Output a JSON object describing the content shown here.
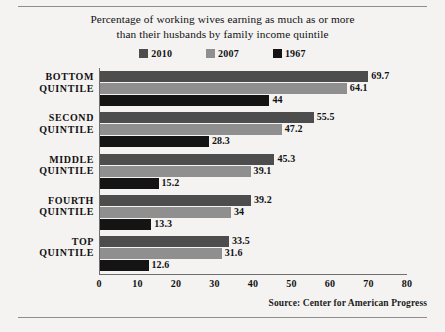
{
  "chart_data": {
    "type": "bar",
    "orientation": "horizontal",
    "title": "Percentage of working wives earning as much as or more than their husbands by family income quintile",
    "title_lines": [
      "Percentage of working wives earning as much as or more",
      "than their husbands by family income quintile"
    ],
    "categories": [
      "BOTTOM QUINTILE",
      "SECOND QUINTILE",
      "MIDDLE QUINTILE",
      "FOURTH QUINTILE",
      "TOP QUINTILE"
    ],
    "category_lines": [
      [
        "BOTTOM",
        "QUINTILE"
      ],
      [
        "SECOND",
        "QUINTILE"
      ],
      [
        "MIDDLE",
        "QUINTILE"
      ],
      [
        "FOURTH",
        "QUINTILE"
      ],
      [
        "TOP",
        "QUINTILE"
      ]
    ],
    "series": [
      {
        "name": "2010",
        "color": "#4d4d4d",
        "values": [
          69.7,
          55.5,
          45.3,
          39.2,
          33.5
        ],
        "labels": [
          "69.7",
          "55.5",
          "45.3",
          "39.2",
          "33.5"
        ]
      },
      {
        "name": "2007",
        "color": "#8f8f8f",
        "values": [
          64.1,
          47.2,
          39.1,
          34,
          31.6
        ],
        "labels": [
          "64.1",
          "47.2",
          "39.1",
          "34",
          "31.6"
        ]
      },
      {
        "name": "1967",
        "color": "#141414",
        "values": [
          44,
          28.3,
          15.2,
          13.3,
          12.6
        ],
        "labels": [
          "44",
          "28.3",
          "15.2",
          "13.3",
          "12.6"
        ]
      }
    ],
    "xlabel": "",
    "ylabel": "",
    "xlim": [
      0,
      80
    ],
    "xticks": [
      0,
      10,
      20,
      30,
      40,
      50,
      60,
      70,
      80
    ],
    "xtick_labels": [
      "0",
      "10",
      "20",
      "30",
      "40",
      "50",
      "60",
      "70",
      "80"
    ],
    "grid": false,
    "legend_position": "top-center",
    "legend_entries": [
      "2010",
      "2007",
      "1967"
    ]
  },
  "source": {
    "text": "Source:  Center for American Progress"
  },
  "colors": {
    "background": "#f4f3f1",
    "axis": "#6f6f6f",
    "rule": "#8d8d8d",
    "text": "#111111"
  }
}
